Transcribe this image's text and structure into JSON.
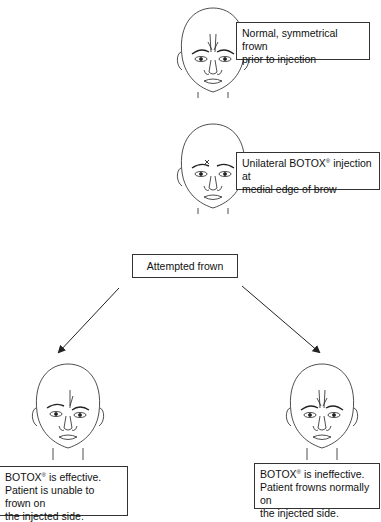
{
  "diagram": {
    "type": "flowchart",
    "steps": [
      {
        "id": "baseline",
        "label": "Normal, symmetrical frown prior to injection",
        "line1": "Normal, symmetrical frown",
        "line2": "prior to injection"
      },
      {
        "id": "injection",
        "label_pre": "Unilateral BOTOX",
        "label_sup": "®",
        "label_post": " injection at",
        "line2": "medial edge of brow"
      },
      {
        "id": "test",
        "label": "Attempted frown"
      }
    ],
    "outcomes": [
      {
        "id": "effective",
        "line1_pre": "BOTOX",
        "line1_sup": "®",
        "line1_post": " is effective.",
        "line2": "Patient is unable to frown on",
        "line3": "the injected side."
      },
      {
        "id": "ineffective",
        "line1_pre": "BOTOX",
        "line1_sup": "®",
        "line1_post": " is ineffective.",
        "line2": "Patient frowns normally on",
        "line3": "the injected side."
      }
    ],
    "faces": [
      {
        "id": "face-baseline",
        "state": "symmetrical-frown"
      },
      {
        "id": "face-injection",
        "state": "neutral-with-injection-mark"
      },
      {
        "id": "face-effective",
        "state": "asymmetric-frown"
      },
      {
        "id": "face-ineffective",
        "state": "symmetrical-frown"
      }
    ],
    "arrows": [
      {
        "from": "test",
        "to": "effective"
      },
      {
        "from": "test",
        "to": "ineffective"
      }
    ],
    "colors": {
      "line": "#222222",
      "box_border": "#333333",
      "background": "#ffffff"
    }
  }
}
